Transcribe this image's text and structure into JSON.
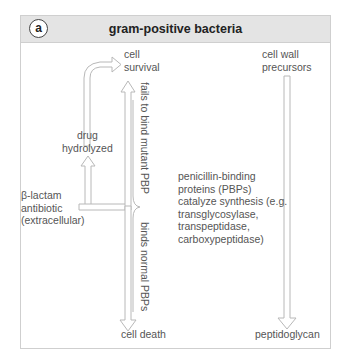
{
  "panel": {
    "badge": "a",
    "title": "gram-positive bacteria"
  },
  "left_pathway": {
    "outcome_top": [
      "cell",
      "survival"
    ],
    "drug_hydrolyzed": [
      "drug",
      "hydrolyzed"
    ],
    "antibiotic": [
      "β-lactam",
      "antibiotic",
      "(extracellular)"
    ],
    "label_up": "fails to bind mutant PBP",
    "label_down": "binds normal PBPs",
    "outcome_bottom": "cell death"
  },
  "middle_text": [
    "penicillin-binding",
    "proteins (PBPs)",
    "catalyze synthesis (e.g.",
    "transglycosylase,",
    "transpeptidase,",
    "carboxypeptidase)"
  ],
  "right_pathway": {
    "start": [
      "cell wall",
      "precursors"
    ],
    "end": "peptidoglycan"
  },
  "colors": {
    "header_bg": "#e4e4e4",
    "border": "#cfcfcf",
    "arrow_stroke": "#b8b8b8",
    "text": "#555555"
  }
}
